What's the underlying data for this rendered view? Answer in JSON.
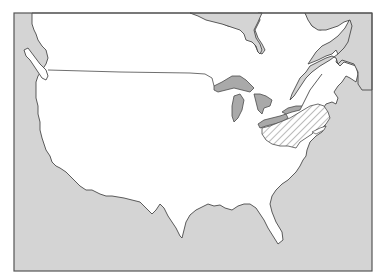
{
  "map": {
    "kind": "outline-map",
    "subject": "Contiguous United States and southeastern Canada",
    "colors": {
      "background": "#ffffff",
      "water": "#d4d4d4",
      "land": "#ffffff",
      "coastline": "#4a4a4a",
      "frame": "#555555",
      "hatch": "#7a7a7a"
    },
    "highlighted_regions": [
      {
        "name": "hatched-region-northeast",
        "pattern": "diagonal-hatch",
        "approx_area": "Pennsylvania / southern New York / eastern Ohio"
      }
    ],
    "water_bodies": [
      "Pacific Ocean",
      "Atlantic Ocean",
      "Gulf of Mexico",
      "Hudson Bay (James Bay)",
      "Great Lakes",
      "Gulf of St. Lawrence",
      "Puget Sound"
    ],
    "labels": []
  }
}
